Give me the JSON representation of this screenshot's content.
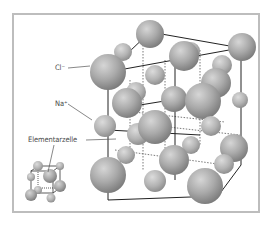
{
  "figure": {
    "labels": {
      "chloride": "Cl⁻",
      "sodium": "Na⁺",
      "unit_cell": "Elementarzelle"
    },
    "colors": {
      "frame": "#bdbdbd",
      "sphere_light": "#d0d0d0",
      "sphere_dark": "#8a8a8a",
      "edge_line": "#222222",
      "hidden_line": "#666666",
      "label_text": "#4a4a4a"
    }
  }
}
